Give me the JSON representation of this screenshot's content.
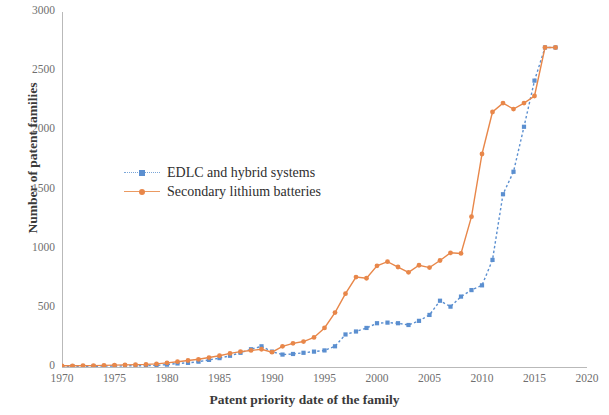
{
  "chart_data": {
    "type": "line",
    "title": "",
    "xlabel": "Patent priority date of the family",
    "ylabel": "Number of patent families",
    "xlim": [
      1970,
      2020
    ],
    "ylim": [
      0,
      3000
    ],
    "xticks": [
      1970,
      1975,
      1980,
      1985,
      1990,
      1995,
      2000,
      2005,
      2010,
      2015,
      2020
    ],
    "yticks": [
      0,
      500,
      1000,
      1500,
      2000,
      2500,
      3000
    ],
    "grid": false,
    "legend_position": "inside-upper-left",
    "x": [
      1970,
      1971,
      1972,
      1973,
      1974,
      1975,
      1976,
      1977,
      1978,
      1979,
      1980,
      1981,
      1982,
      1983,
      1984,
      1985,
      1986,
      1987,
      1988,
      1989,
      1990,
      1991,
      1992,
      1993,
      1994,
      1995,
      1996,
      1997,
      1998,
      1999,
      2000,
      2001,
      2002,
      2003,
      2004,
      2005,
      2006,
      2007,
      2008,
      2009,
      2010,
      2011,
      2012,
      2013,
      2014,
      2015,
      2016,
      2017
    ],
    "series": [
      {
        "name": "EDLC and hybrid systems",
        "color": "#5b8fd0",
        "line_style": "dotted",
        "marker": "square",
        "values": [
          5,
          5,
          6,
          6,
          8,
          8,
          10,
          10,
          12,
          14,
          20,
          30,
          35,
          45,
          60,
          75,
          95,
          120,
          150,
          175,
          130,
          105,
          110,
          120,
          130,
          140,
          175,
          275,
          300,
          330,
          370,
          375,
          370,
          355,
          390,
          440,
          560,
          510,
          595,
          650,
          690,
          905,
          1460,
          1650,
          2030,
          2420,
          2700,
          2700
        ]
      },
      {
        "name": "Secondary lithium batteries",
        "color": "#e8874a",
        "line_style": "solid",
        "marker": "circle",
        "values": [
          10,
          10,
          12,
          12,
          14,
          16,
          18,
          20,
          22,
          26,
          35,
          45,
          55,
          65,
          80,
          95,
          115,
          130,
          140,
          150,
          125,
          175,
          200,
          215,
          250,
          330,
          460,
          620,
          760,
          750,
          855,
          890,
          845,
          800,
          860,
          840,
          900,
          965,
          960,
          1270,
          1800,
          2155,
          2230,
          2180,
          2230,
          2290,
          2700,
          2700
        ]
      }
    ]
  },
  "axes": {
    "y_tick_labels": [
      "3000",
      "2500",
      "2000",
      "1500",
      "1000",
      "500",
      "0"
    ],
    "x_tick_labels": [
      "1970",
      "1975",
      "1980",
      "1985",
      "1990",
      "1995",
      "2000",
      "2005",
      "2010",
      "2015",
      "2020"
    ],
    "y_axis_title": "Number of patent families",
    "x_axis_title": "Patent priority date of the family"
  },
  "legend": {
    "items": [
      {
        "label": "EDLC and hybrid systems",
        "marker": "square-marker",
        "style": "dotted"
      },
      {
        "label": "Secondary lithium batteries",
        "marker": "circle-marker",
        "style": "solid"
      }
    ]
  }
}
